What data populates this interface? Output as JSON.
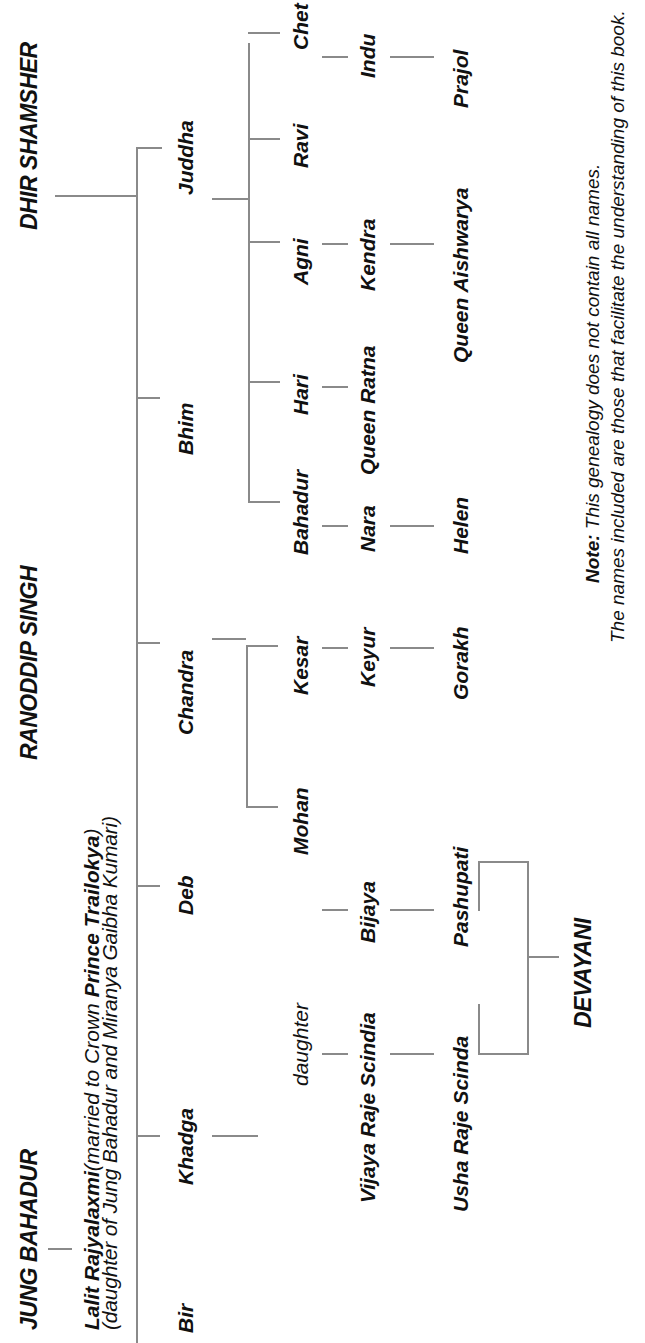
{
  "diagram": {
    "type": "genealogy-tree",
    "orientation": "rotated-90-ccw",
    "roots": {
      "jung_bahadur": "JUNG BAHADUR",
      "ranoddip_singh": "RANODDIP SINGH",
      "dhir_shamsher": "DHIR SHAMSHER"
    },
    "lalit": {
      "name": "Lalit Rajyalaxmi",
      "married_prefix": "(married to Crown ",
      "spouse": "Prince Trailokya",
      "married_suffix": ")",
      "line2": "(daughter of Jung Bahadur and Miranya Gaibha Kumari)"
    },
    "generation1": [
      "Bir",
      "Khadga",
      "Deb",
      "Chandra",
      "Bhim",
      "Juddha"
    ],
    "chandra_children": [
      "Mohan",
      "Kesar"
    ],
    "juddha_children": [
      "Bahadur",
      "Hari",
      "Agni",
      "Ravi",
      "Chet"
    ],
    "khadga_line": [
      "daughter",
      "Vijaya Raje Scindia",
      "Usha Raje Scinda"
    ],
    "mohan_line": [
      "Bijaya",
      "Pashupati"
    ],
    "kesar_line": [
      "Keyur",
      "Gorakh"
    ],
    "bahadur_line": [
      "Nara",
      "Helen"
    ],
    "hari_line": [
      "Queen Ratna"
    ],
    "agni_line": [
      "Kendra",
      "Queen Aishwarya"
    ],
    "chet_line": [
      "Indu",
      "Prajol"
    ],
    "devayani": "DEVAYANI",
    "note": {
      "label": "Note:",
      "line1": " This genealogy does not contain all names.",
      "line2": "The names included are those that facilitate the understanding of this book."
    }
  },
  "colors": {
    "line": "#8a8a8a",
    "text": "#111111",
    "background": "#ffffff"
  }
}
